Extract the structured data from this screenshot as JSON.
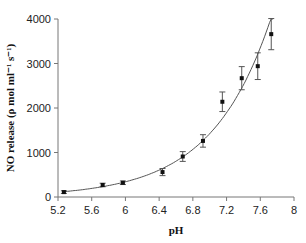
{
  "chart_data": {
    "type": "scatter",
    "title": "",
    "xlabel": "pH",
    "ylabel": "NO release (ρ mol ml⁻¹ s⁻¹)",
    "xlim": [
      5.2,
      8
    ],
    "ylim": [
      0,
      4000
    ],
    "x_ticks": [
      "5.2",
      "5.6",
      "6",
      "6.4",
      "6.8",
      "7.2",
      "7.6",
      "8"
    ],
    "y_ticks": [
      "0",
      "1000",
      "2000",
      "3000",
      "4000"
    ],
    "grid": false,
    "legend": null,
    "series": [
      {
        "name": "NO release",
        "style": "points with error bars",
        "x": [
          5.27,
          5.73,
          5.97,
          6.44,
          6.68,
          6.92,
          7.15,
          7.38,
          7.57,
          7.73
        ],
        "y": [
          110,
          270,
          320,
          560,
          910,
          1260,
          2140,
          2670,
          2940,
          3660
        ],
        "error": [
          30,
          40,
          40,
          80,
          110,
          140,
          220,
          260,
          300,
          350
        ]
      },
      {
        "name": "Exponential fit",
        "style": "line",
        "model": "y = a·exp(b·x)",
        "x": [
          5.2,
          5.6,
          6.0,
          6.4,
          6.8,
          7.2,
          7.6,
          7.73
        ],
        "y": [
          130,
          200,
          330,
          540,
          890,
          1460,
          2950,
          4000
        ]
      }
    ]
  }
}
